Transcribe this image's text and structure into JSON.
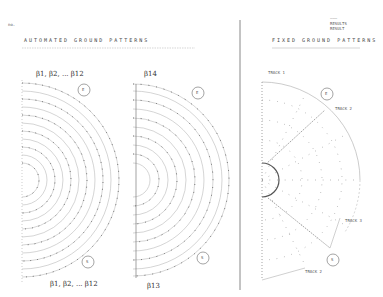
{
  "page": {
    "mark": "no.",
    "left_section": {
      "title": "AUTOMATED   GROUND   PATTERNS",
      "pattern_a": {
        "top_label": "β1, β2, ... β12",
        "bottom_label": "β1, β2, ... β12",
        "north_marker": "E",
        "south_marker": "S"
      },
      "pattern_b": {
        "top_label": "β14",
        "bottom_label": "β13",
        "north_marker": "E",
        "south_marker": "S"
      }
    },
    "right_section": {
      "title": "FIXED   GROUND   PATTERNS",
      "stamp_lines": [
        "———",
        "RESULTS",
        "RESULT"
      ],
      "north_marker": "E",
      "south_marker": "S",
      "tracks": [
        "TRACK 1",
        "TRACK 2",
        "TRACK 3",
        "TRACK 2"
      ]
    }
  }
}
